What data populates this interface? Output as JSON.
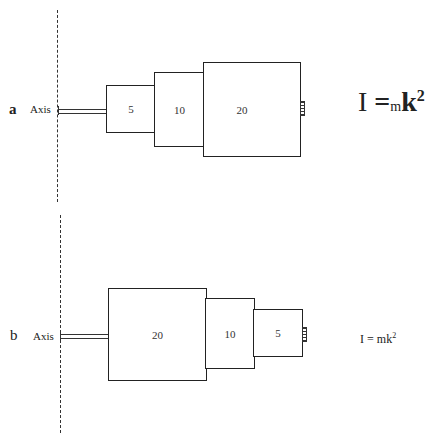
{
  "figure": {
    "panels": [
      {
        "id": "a",
        "letter": "a",
        "axis_label": "Axis",
        "masses": [
          "5",
          "10",
          "20"
        ],
        "formula": {
          "lhs": "I",
          "eq": "=",
          "m": "m",
          "k": "k",
          "exp": "2"
        }
      },
      {
        "id": "b",
        "letter": "b",
        "axis_label": "Axis",
        "masses": [
          "20",
          "10",
          "5"
        ],
        "formula": {
          "lhs": "I",
          "eq": "=",
          "m": "m",
          "k": "k",
          "exp": "2"
        }
      }
    ]
  }
}
